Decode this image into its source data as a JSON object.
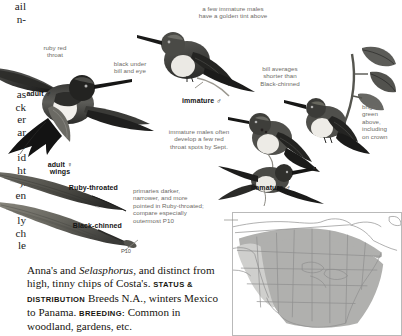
{
  "page": {
    "species": "Ruby-throated Hummingbird",
    "background_color": "#ffffff",
    "label_color": "#6d6b66",
    "plate_label_color": "#141414"
  },
  "cut_off_left_column": {
    "note": "fragments of previous text column clipped at left edge",
    "lines": [
      "ail",
      "n-",
      "",
      "",
      "",
      "",
      "",
      "as",
      "ck",
      "er",
      "ar",
      "er",
      "id",
      "ht",
      ").",
      "en",
      "ng",
      "ly",
      "ch",
      "le"
    ]
  },
  "annotations": [
    {
      "id": "ruby-red-throat",
      "text": "ruby red\nthroat",
      "x": 28,
      "y": 44,
      "w": 54,
      "align": "center"
    },
    {
      "id": "black-under-bill",
      "text": "black under\nbill and eye",
      "x": 101,
      "y": 60,
      "w": 58,
      "align": "center"
    },
    {
      "id": "golden-tint",
      "text": "a few immature males\nhave a golden tint above",
      "x": 183,
      "y": 5,
      "w": 100,
      "align": "center"
    },
    {
      "id": "bill-averages",
      "text": "bill averages\nshorter than\nBlack-chinned",
      "x": 248,
      "y": 65,
      "w": 64,
      "align": "center"
    },
    {
      "id": "bright-green",
      "text": "bright\ngreen\nabove,\nincluding\non crown",
      "x": 362,
      "y": 103,
      "w": 40,
      "align": "left"
    },
    {
      "id": "immature-red-spots",
      "text": "immature males often\ndevelop a few red\nthroat spots by Sept.",
      "x": 150,
      "y": 128,
      "w": 98,
      "align": "center"
    },
    {
      "id": "primaries-note",
      "text": "primaries darker,\nnarrower, and more\npointed in Ruby-throated;\ncompare especially\noutermost P10",
      "x": 133,
      "y": 187,
      "w": 96,
      "align": "left"
    }
  ],
  "plate_labels": [
    {
      "id": "adult-male",
      "text": "adult ♂",
      "x": 17,
      "y": 90,
      "w": 34,
      "align": "right"
    },
    {
      "id": "adult-female-wings",
      "text": "adult ♀\nwings",
      "x": 42,
      "y": 161,
      "w": 36,
      "align": "center"
    },
    {
      "id": "ruby-throated-wing",
      "text": "Ruby-throated",
      "x": 60,
      "y": 184,
      "w": 58,
      "align": "right"
    },
    {
      "id": "black-chinned-wing",
      "text": "Black-chinned",
      "x": 62,
      "y": 222,
      "w": 60,
      "align": "right"
    },
    {
      "id": "immature-male-upper",
      "text": "immature ♂",
      "x": 182,
      "y": 97,
      "w": 46,
      "align": "left"
    },
    {
      "id": "immature-male-lower",
      "text": "immature ♂",
      "x": 251,
      "y": 184,
      "w": 46,
      "align": "left"
    }
  ],
  "tiny_labels": [
    {
      "id": "p10",
      "text": "P10",
      "x": 121,
      "y": 248
    },
    {
      "id": "female-symbol",
      "text": "♀",
      "x": 312,
      "y": 165
    }
  ],
  "body_text": {
    "line1_plain": "Anna's and ",
    "line1_italic": "Selasphorus",
    "line1_rest": ", and distinct",
    "line2": "from high, tinny chips of Costa's.",
    "heading1": "STATUS & DISTRIBUTION",
    "after_heading1": " Breeds N.A.,",
    "line4": "winters Mexico to Panama. ",
    "heading2": "BREEDING:",
    "line5": "Common in woodland, gardens, etc."
  },
  "map": {
    "title": "range map",
    "region": "North America",
    "range_fill": "#b0b0ae",
    "range_fill_light": "#cfcfcd",
    "border_color": "#b9b9b9",
    "outline_color": "#8e8e8e"
  }
}
